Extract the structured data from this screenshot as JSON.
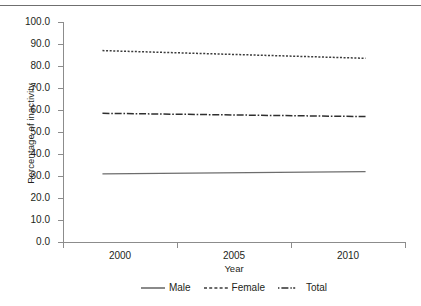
{
  "chart_data": {
    "type": "line",
    "title": "",
    "subtitle": "",
    "xlabel": "Year",
    "ylabel": "Percentage of inactivity",
    "x": [
      2000,
      2010
    ],
    "categories": [
      "2000",
      "2005",
      "2010"
    ],
    "xlim": [
      1998.5,
      2011.5
    ],
    "ylim": [
      0.0,
      100.0
    ],
    "ytick_labels": [
      "100.0",
      "90.0",
      "80.0",
      "70.0",
      "60.0",
      "50.0",
      "40.0",
      "30.0",
      "20.0",
      "10.0",
      "0.0"
    ],
    "ytick_values": [
      100.0,
      90.0,
      80.0,
      70.0,
      60.0,
      50.0,
      40.0,
      30.0,
      20.0,
      10.0,
      0.0
    ],
    "xtick_labels": [
      "2000",
      "2005",
      "2010"
    ],
    "xtick_values": [
      2000,
      2005,
      2010
    ],
    "grid": false,
    "legend_position": "bottom",
    "series": [
      {
        "name": "Male",
        "style": "solid",
        "color": "#6d6d6d",
        "x": [
          2000,
          2010
        ],
        "values": [
          31.0,
          32.0
        ]
      },
      {
        "name": "Female",
        "style": "dotted",
        "color": "#3b3b3b",
        "x": [
          2000,
          2010
        ],
        "values": [
          87.0,
          83.5
        ]
      },
      {
        "name": "Total",
        "style": "dash-dot",
        "color": "#2f2f2f",
        "x": [
          2000,
          2010
        ],
        "values": [
          58.5,
          57.0
        ]
      }
    ]
  },
  "legend": {
    "items": [
      {
        "label": "Male"
      },
      {
        "label": "Female"
      },
      {
        "label": "Total"
      }
    ]
  },
  "axes": {
    "y_title": "Percentage of inactivity",
    "x_title": "Year"
  },
  "colors": {
    "axis": "#8c8c8c",
    "text": "#231f20",
    "rule": "#6f6f6f",
    "male": "#6d6d6d",
    "female": "#3b3b3b",
    "total": "#2f2f2f"
  }
}
